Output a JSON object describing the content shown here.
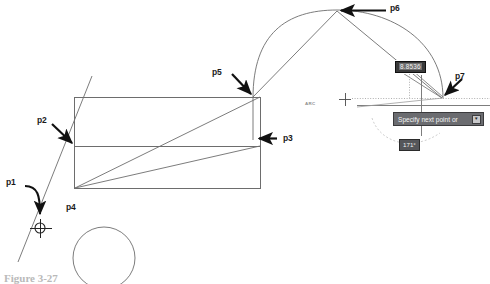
{
  "canvas": {
    "width": 490,
    "height": 280,
    "background": "#ffffff"
  },
  "colors": {
    "geometry_line": "#6d6d6d",
    "annotation": "#1a1a1a",
    "tooltip_bg": "#6b6c70",
    "value_field_bg": "#3a3a3a",
    "value_selection": "#6f6f6f",
    "angle_bg": "#55565a",
    "tracking_guide": "#a8a8a8",
    "caption_text": "#b9b9b9"
  },
  "point_labels": [
    {
      "id": "p1",
      "text": "p1",
      "x": 6,
      "y": 181
    },
    {
      "id": "p2",
      "text": "p2",
      "x": 37,
      "y": 119
    },
    {
      "id": "p3",
      "text": "p3",
      "x": 283,
      "y": 133
    },
    {
      "id": "p4",
      "text": "p4",
      "x": 66,
      "y": 204
    },
    {
      "id": "p5",
      "text": "p5",
      "x": 212,
      "y": 69
    },
    {
      "id": "p6",
      "text": "p6",
      "x": 390,
      "y": 4
    },
    {
      "id": "p7",
      "text": "p7",
      "x": 455,
      "y": 73
    }
  ],
  "command_label": {
    "text": "ARC",
    "x": 305,
    "y": 103
  },
  "dynamic_input": {
    "distance_field": {
      "value": "8.8536",
      "x": 395,
      "y": 61,
      "selected": true
    },
    "angle_readout": {
      "value": "171°",
      "x": 399,
      "y": 139
    },
    "prompt": {
      "text": "Specify next point or",
      "arrow_glyph": "▼",
      "x": 393,
      "y": 112
    }
  },
  "caption": {
    "text": "Figure 3-27"
  },
  "geometry": {
    "rectangle": {
      "x": 74,
      "y": 97,
      "width": 186,
      "height": 91
    },
    "divider_y": 146,
    "circle": {
      "cx": 104,
      "cy": 258,
      "r": 31
    },
    "arc_apex": {
      "x": 337,
      "y": 10
    },
    "arc_start": {
      "x": 253,
      "y": 97
    },
    "arc_end": {
      "x": 443,
      "y": 98
    },
    "cursor_crosshair": {
      "x": 345,
      "y": 99
    },
    "p1_marker": {
      "x": 40,
      "y": 228
    }
  }
}
